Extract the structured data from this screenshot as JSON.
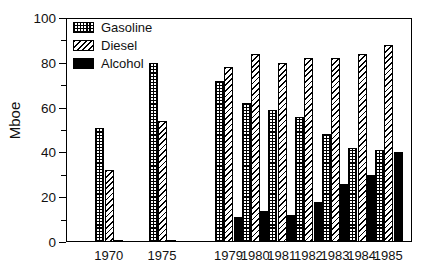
{
  "chart_data": {
    "type": "bar",
    "title": "",
    "xlabel": "",
    "ylabel": "Mboe",
    "ylim": [
      0,
      100
    ],
    "ytick_values": [
      0,
      20,
      40,
      60,
      80,
      100
    ],
    "ytick_labels": [
      "0",
      "20",
      "40",
      "60",
      "80",
      "100"
    ],
    "yminor_tick_values": [
      10,
      30,
      50,
      70,
      90
    ],
    "grid": false,
    "legend_position": "top-left",
    "categories": [
      "1970",
      "1975",
      "1979",
      "1980",
      "1981",
      "1982",
      "1983",
      "1984",
      "1985"
    ],
    "series": [
      {
        "name": "Gasoline",
        "pattern": "crosshatch",
        "color": "#000000",
        "values": [
          51,
          80,
          72,
          62,
          59,
          56,
          48,
          42,
          41
        ]
      },
      {
        "name": "Diesel",
        "pattern": "diagonal-hatch",
        "color": "#000000",
        "values": [
          32,
          54,
          78,
          84,
          80,
          82,
          82,
          84,
          88
        ]
      },
      {
        "name": "Alcohol",
        "pattern": "solid",
        "color": "#000000",
        "values": [
          1,
          1,
          11,
          14,
          12,
          18,
          26,
          30,
          40
        ]
      }
    ],
    "group_x_positions": [
      11,
      31,
      56,
      66,
      76,
      86,
      96,
      106,
      116
    ]
  },
  "legend": {
    "items": [
      {
        "label": "Gasoline",
        "swatch": "crosshatch-swatch"
      },
      {
        "label": "Diesel",
        "swatch": "diagonal-hatch-swatch"
      },
      {
        "label": "Alcohol",
        "swatch": "solid-black-swatch"
      }
    ]
  }
}
